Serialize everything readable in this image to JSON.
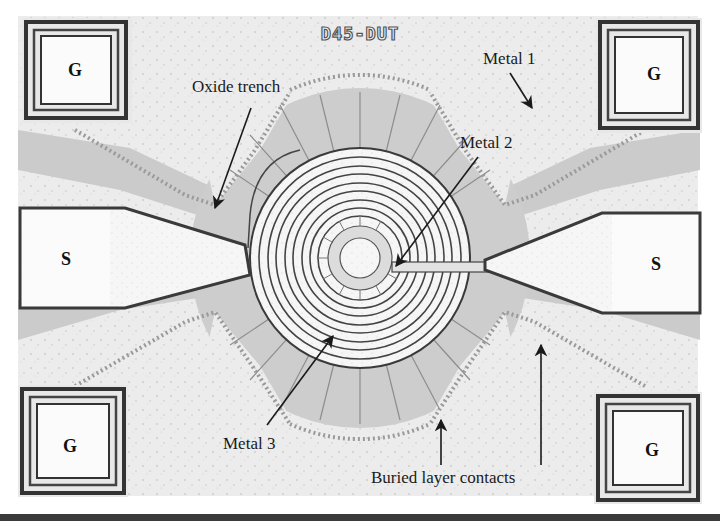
{
  "figure": {
    "chip_id": "D45-DUT",
    "pads": {
      "top_left": "G",
      "top_right": "G",
      "left": "S",
      "right": "S",
      "bottom_left": "G",
      "bottom_right": "G"
    },
    "annotations": {
      "oxide_trench": "Oxide trench",
      "metal_1": "Metal 1",
      "metal_2": "Metal 2",
      "metal_3": "Metal 3",
      "buried_layer_contacts": "Buried layer contacts"
    },
    "colors": {
      "substrate": "#eeeeee",
      "oxide": "#c9c9c9",
      "pad_border": "#3a3a3a",
      "pad_fill": "#fbfbfb",
      "ink": "#1a1a1a",
      "contacts": "#9a9a9a"
    }
  }
}
